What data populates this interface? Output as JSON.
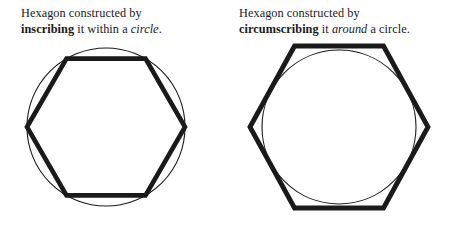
{
  "document": {
    "type": "geometry-illustration",
    "background_color": "#ffffff",
    "ink_color": "#1a1a1a"
  },
  "panels": [
    {
      "id": "inscribed",
      "caption": {
        "line1": "Hexagon constructed by",
        "line2_bold": "inscribing",
        "line2_mid": " it within a ",
        "line2_italic": "circle",
        "line2_end": "."
      },
      "figure": {
        "name": "hexagon-inscribed-in-circle",
        "circle": {
          "cx": 106,
          "cy": 127,
          "r": 79,
          "stroke": "#1a1a1a",
          "stroke_width": 1.1,
          "fill": "none"
        },
        "hexagon": {
          "stroke": "#1a1a1a",
          "stroke_width": 4.6,
          "fill": "none",
          "orientation": "pointy-left-right",
          "points": "27,127 66.5,58.6 145.5,58.6 185,127 145.5,195.4 66.5,195.4"
        },
        "relationship": "hexagon vertices lie on the circle"
      }
    },
    {
      "id": "circumscribed",
      "caption": {
        "line1": "Hexagon constructed by",
        "line2_bold": "circumscribing",
        "line2_mid": " it ",
        "line2_italic": "around",
        "line2_end": " a circle."
      },
      "figure": {
        "name": "hexagon-circumscribed-around-circle",
        "circle": {
          "cx": 114,
          "cy": 127,
          "r": 77,
          "stroke": "#1a1a1a",
          "stroke_width": 1.1,
          "fill": "none"
        },
        "hexagon": {
          "stroke": "#1a1a1a",
          "stroke_width": 4.8,
          "fill": "none",
          "orientation": "pointy-left-right",
          "points": "25,127 69.5,46 158.5,46 203,127 158.5,208 69.5,208"
        },
        "relationship": "circle is tangent to all six hexagon edges"
      }
    }
  ]
}
